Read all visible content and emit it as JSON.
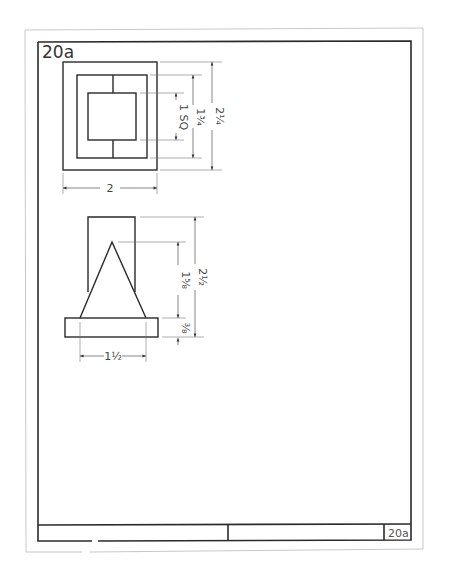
{
  "sheet": {
    "id_label": "20a",
    "title_block_id": "20a"
  },
  "top_view": {
    "dimensions": {
      "width": "2",
      "outer_height": "2¼",
      "middle_height": "1¾",
      "inner_square": "1 SQ"
    }
  },
  "front_view": {
    "dimensions": {
      "overall_height": "2½",
      "triangle_height": "1⅝",
      "base_thickness": "⅜",
      "base_span": "1½"
    }
  },
  "colors": {
    "line": "#2a2a2a",
    "dimension": "#555555",
    "sheet_edge": "#c8c8c8",
    "background": "#ffffff"
  }
}
